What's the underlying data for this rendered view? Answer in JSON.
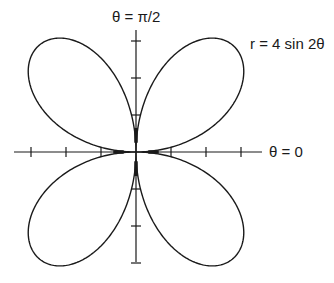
{
  "labels": {
    "axis_top": "θ = π/2",
    "axis_right": "θ = 0",
    "equation": "r = 4 sin 2θ"
  },
  "colors": {
    "stroke": "#1a1a1a",
    "background": "#ffffff"
  },
  "chart_data": {
    "type": "polar-curve",
    "title": "",
    "equation": "r = 4 sin 2θ",
    "amplitude": 4,
    "frequency": 2,
    "petals": 4,
    "axis_labels": {
      "polar_axis": "θ = 0",
      "vertical_axis": "θ = π/2"
    },
    "tick_marks": {
      "x_axis": [
        -3,
        -2,
        -1,
        1,
        2,
        3
      ],
      "y_axis": [
        -3,
        -2,
        -1,
        1,
        2,
        3
      ]
    },
    "axis_range": {
      "x": [
        -3.5,
        3.5
      ],
      "y": [
        -3.3,
        3.3
      ]
    },
    "grid": false,
    "legend": false,
    "layout": {
      "origin_px": [
        136,
        152
      ],
      "unit_px_x": 35,
      "unit_px_y": 37
    }
  }
}
